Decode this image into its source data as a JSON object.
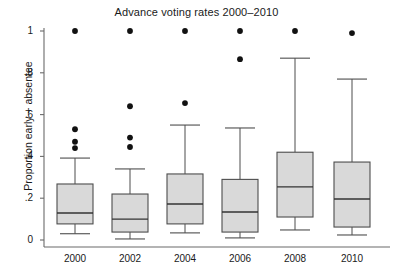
{
  "chart_data": {
    "type": "box",
    "title": "Advance voting rates 2000–2010",
    "xlabel": "",
    "ylabel": "Proportion early + absentee",
    "categories": [
      "2000",
      "2002",
      "2004",
      "2006",
      "2008",
      "2010"
    ],
    "ylim": [
      0,
      1
    ],
    "yticks": [
      0,
      0.2,
      0.4,
      0.6,
      0.8,
      1
    ],
    "ytick_labels": [
      "0",
      ".2",
      ".4",
      ".6",
      ".8",
      "1"
    ],
    "grid": false,
    "legend": null,
    "box_fill": "#d9d9d9",
    "box_stroke": "#4d4d4d",
    "outlier_color": "#111111",
    "boxes": [
      {
        "category": "2000",
        "whisker_low": 0.03,
        "q1": 0.077,
        "median": 0.129,
        "q3": 0.268,
        "whisker_high": 0.392,
        "outliers": [
          0.44,
          0.47,
          0.53,
          1.0
        ]
      },
      {
        "category": "2002",
        "whisker_low": 0.005,
        "q1": 0.038,
        "median": 0.1,
        "q3": 0.22,
        "whisker_high": 0.34,
        "outliers": [
          0.445,
          0.49,
          0.64,
          1.0
        ]
      },
      {
        "category": "2004",
        "whisker_low": 0.034,
        "q1": 0.077,
        "median": 0.172,
        "q3": 0.316,
        "whisker_high": 0.55,
        "outliers": [
          0.655,
          1.0
        ]
      },
      {
        "category": "2006",
        "whisker_low": 0.01,
        "q1": 0.038,
        "median": 0.134,
        "q3": 0.29,
        "whisker_high": 0.536,
        "outliers": [
          0.865,
          1.0
        ]
      },
      {
        "category": "2008",
        "whisker_low": 0.048,
        "q1": 0.11,
        "median": 0.254,
        "q3": 0.42,
        "whisker_high": 0.87,
        "outliers": [
          1.0
        ]
      },
      {
        "category": "2010",
        "whisker_low": 0.024,
        "q1": 0.062,
        "median": 0.196,
        "q3": 0.373,
        "whisker_high": 0.77,
        "outliers": [
          0.99
        ]
      }
    ]
  }
}
